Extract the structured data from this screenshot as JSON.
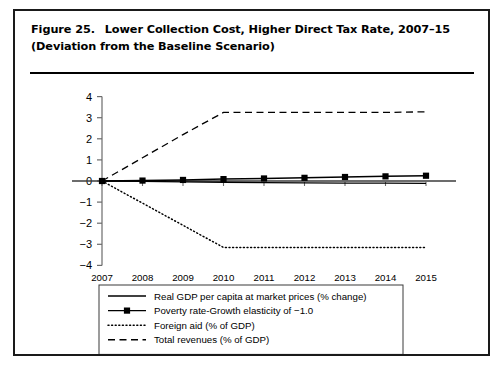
{
  "figure": {
    "label": "Figure 25.",
    "title": "Lower Collection Cost, Higher Direct Tax Rate, 2007–15 (Deviation from the Baseline Scenario)"
  },
  "chart_data": {
    "type": "line",
    "title": "Lower Collection Cost, Higher Direct Tax Rate, 2007–15 (Deviation from the Baseline Scenario)",
    "xlabel": "",
    "ylabel": "",
    "x": [
      2007,
      2008,
      2009,
      2010,
      2011,
      2012,
      2013,
      2014,
      2015
    ],
    "categories": [
      "2007",
      "2008",
      "2009",
      "2010",
      "2011",
      "2012",
      "2013",
      "2014",
      "2015"
    ],
    "xlim": [
      2007,
      2015
    ],
    "ylim": [
      -4,
      4
    ],
    "yticks": [
      4,
      3,
      2,
      1,
      0,
      -1,
      -2,
      -3,
      -4
    ],
    "ytick_labels": [
      "4",
      "3",
      "2",
      "1",
      "0",
      "−1",
      "−2",
      "−3",
      "−4"
    ],
    "grid": false,
    "legend_position": "below",
    "series": [
      {
        "name": "Real GDP per capita at market prices (% change)",
        "style": "solid",
        "marker": "none",
        "color": "#000000",
        "values": [
          0.0,
          -0.02,
          -0.04,
          -0.06,
          -0.08,
          -0.09,
          -0.1,
          -0.1,
          -0.11
        ]
      },
      {
        "name": "Poverty rate-Growth elasticity of −1.0",
        "style": "solid",
        "marker": "square",
        "color": "#000000",
        "values": [
          0.0,
          0.02,
          0.05,
          0.09,
          0.12,
          0.15,
          0.19,
          0.22,
          0.25
        ]
      },
      {
        "name": "Foreign aid (% of GDP)",
        "style": "dotted",
        "marker": "none",
        "color": "#000000",
        "values": [
          0.0,
          -1.05,
          -2.1,
          -3.15,
          -3.15,
          -3.15,
          -3.15,
          -3.15,
          -3.15
        ]
      },
      {
        "name": "Total revenues (% of GDP)",
        "style": "dashed",
        "marker": "none",
        "color": "#000000",
        "values": [
          0.0,
          1.1,
          2.2,
          3.25,
          3.25,
          3.25,
          3.25,
          3.25,
          3.28
        ]
      }
    ]
  },
  "legend": {
    "items": [
      {
        "label": "Real GDP per capita at market prices (% change)",
        "style": "solid",
        "marker": "none"
      },
      {
        "label": "Poverty rate-Growth elasticity of −1.0",
        "style": "solid",
        "marker": "square"
      },
      {
        "label": "Foreign aid (% of GDP)",
        "style": "dotted",
        "marker": "none"
      },
      {
        "label": "Total revenues (% of GDP)",
        "style": "dashed",
        "marker": "none"
      }
    ]
  }
}
